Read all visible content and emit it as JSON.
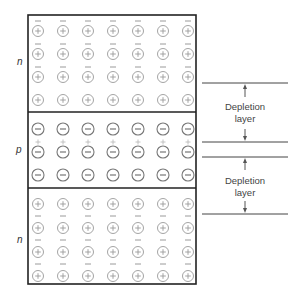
{
  "diagram": {
    "title": "",
    "colors": {
      "box_border": "#222222",
      "charge_gray": "#9a9a9a",
      "acceptor_gray": "#777777",
      "line": "#444444"
    },
    "regions": [
      {
        "id": "n-top",
        "label": "n",
        "type": "n"
      },
      {
        "id": "p-middle",
        "label": "p",
        "type": "p"
      },
      {
        "id": "n-bottom",
        "label": "n",
        "type": "n"
      }
    ],
    "depletion_labels": [
      {
        "line1": "Depletion",
        "line2": "layer"
      },
      {
        "line1": "Depletion",
        "line2": "layer"
      }
    ],
    "columns": 7,
    "glyphs": {
      "donor_ion": "circled-plus",
      "acceptor_ion": "circled-minus",
      "free_electron": "minus",
      "hole": "plus"
    }
  }
}
